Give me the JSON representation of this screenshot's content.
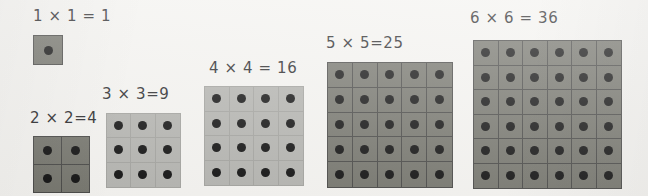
{
  "page": {
    "background_color": "#f4f3f0",
    "text_color": "#2a2a2c",
    "dot_color": "#141414"
  },
  "groups": [
    {
      "id": "one-by-one",
      "label": "1 × 1 = 1",
      "n": 1,
      "total": 1,
      "fill_color": "#77776f",
      "grid_line_color": "#4a4a48",
      "tone": "dark",
      "left": 33,
      "top": 35,
      "size": 30,
      "dot_size": 9,
      "label_left": 33,
      "label_top": 9
    },
    {
      "id": "two-by-two",
      "label": "2 × 2=4",
      "n": 2,
      "total": 4,
      "fill_color": "#77776f",
      "grid_line_color": "#4a4a48",
      "tone": "dark",
      "left": 33,
      "top": 136,
      "size": 57,
      "dot_size": 9,
      "label_left": 30,
      "label_top": 111
    },
    {
      "id": "three-by-three",
      "label": "3 × 3=9",
      "n": 3,
      "total": 9,
      "fill_color": "#b4b4b0",
      "grid_line_color": "#a3a39f",
      "tone": "light",
      "left": 106,
      "top": 113,
      "size": 75,
      "dot_size": 9,
      "label_left": 102,
      "label_top": 87
    },
    {
      "id": "four-by-four",
      "label": "4 × 4 = 16",
      "n": 4,
      "total": 16,
      "fill_color": "#b4b4b0",
      "grid_line_color": "#a3a39f",
      "tone": "light",
      "left": 204,
      "top": 86,
      "size": 100,
      "dot_size": 9,
      "label_left": 209,
      "label_top": 61
    },
    {
      "id": "five-by-five",
      "label": "5 × 5=25",
      "n": 5,
      "total": 25,
      "fill_color": "#77776f",
      "grid_line_color": "#4a4a48",
      "tone": "dark",
      "left": 327,
      "top": 62,
      "size": 126,
      "dot_size": 9,
      "label_left": 326,
      "label_top": 36
    },
    {
      "id": "six-by-six",
      "label": "6 × 6 = 36",
      "n": 6,
      "total": 36,
      "fill_color": "#77776f",
      "grid_line_color": "#4a4a48",
      "tone": "dark",
      "left": 473,
      "top": 40,
      "size": 149,
      "dot_size": 9,
      "label_left": 470,
      "label_top": 11
    }
  ]
}
